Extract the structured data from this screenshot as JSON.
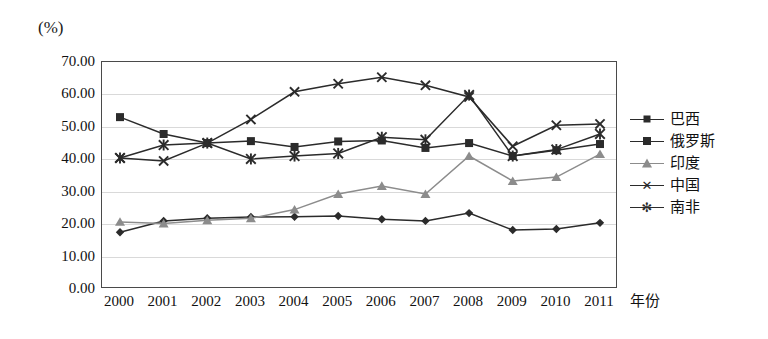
{
  "chart_data": {
    "type": "line",
    "title": "",
    "xlabel": "年份",
    "ylabel": "(%)",
    "ylim": [
      0,
      70
    ],
    "ytick_step": 10,
    "grid": true,
    "legend_position": "right",
    "categories": [
      "2000",
      "2001",
      "2002",
      "2003",
      "2004",
      "2005",
      "2006",
      "2007",
      "2008",
      "2009",
      "2010",
      "2011"
    ],
    "ytick_labels": [
      "70.00",
      "60.00",
      "50.00",
      "40.00",
      "30.00",
      "20.00",
      "10.00",
      "0.00"
    ],
    "series": [
      {
        "name": "巴西",
        "marker": "diamond",
        "color": "#2b2b2b",
        "values": [
          17.5,
          21.0,
          21.8,
          22.2,
          22.3,
          22.5,
          21.5,
          21.0,
          23.4,
          18.2,
          18.5,
          20.4
        ]
      },
      {
        "name": "俄罗斯",
        "marker": "square",
        "color": "#2b2b2b",
        "values": [
          53.0,
          47.8,
          45.0,
          45.6,
          43.8,
          45.5,
          45.8,
          43.5,
          45.0,
          41.0,
          42.8,
          44.7
        ]
      },
      {
        "name": "印度",
        "marker": "triangle",
        "color": "#8c8c8c",
        "values": [
          20.7,
          20.2,
          21.2,
          21.8,
          24.5,
          29.3,
          31.8,
          29.3,
          41.0,
          33.3,
          34.5,
          41.6
        ]
      },
      {
        "name": "中国",
        "marker": "cross",
        "color": "#2b2b2b",
        "values": [
          40.4,
          39.5,
          45.0,
          52.3,
          60.8,
          63.3,
          65.3,
          62.8,
          59.2,
          44.0,
          50.5,
          50.9
        ]
      },
      {
        "name": "南非",
        "marker": "star",
        "color": "#2b2b2b",
        "values": [
          40.4,
          44.4,
          45.0,
          40.1,
          41.0,
          41.8,
          46.8,
          46.0,
          59.8,
          41.0,
          43.0,
          47.8
        ]
      }
    ]
  }
}
